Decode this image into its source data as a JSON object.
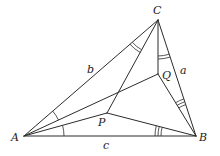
{
  "figure": {
    "width": 220,
    "height": 156,
    "stroke_color": "#2b2b2b",
    "points": {
      "A": {
        "x": 24,
        "y": 136,
        "label": "A",
        "lx": 11,
        "ly": 141
      },
      "B": {
        "x": 196,
        "y": 136,
        "label": "B",
        "lx": 199,
        "ly": 141
      },
      "C": {
        "x": 158,
        "y": 20,
        "label": "C",
        "lx": 153,
        "ly": 14
      },
      "P": {
        "x": 107,
        "y": 113,
        "label": "P",
        "lx": 98,
        "ly": 126
      },
      "Q": {
        "x": 158,
        "y": 74,
        "label": "Q",
        "lx": 162,
        "ly": 79
      }
    },
    "segments": [
      [
        "A",
        "B"
      ],
      [
        "B",
        "C"
      ],
      [
        "C",
        "A"
      ],
      [
        "A",
        "Q"
      ],
      [
        "A",
        "P"
      ],
      [
        "P",
        "B"
      ],
      [
        "P",
        "C"
      ],
      [
        "Q",
        "B"
      ],
      [
        "C",
        "Q"
      ]
    ],
    "side_labels": [
      {
        "text": "a",
        "x": 180,
        "y": 74
      },
      {
        "text": "b",
        "x": 87,
        "y": 73
      },
      {
        "text": "c",
        "x": 103,
        "y": 149
      }
    ],
    "angle_marks": [
      {
        "vertex": "A",
        "from": "Q",
        "to": "C",
        "count": 1,
        "r": 38
      },
      {
        "vertex": "A",
        "from": "B",
        "to": "P",
        "count": 1,
        "r": 40
      },
      {
        "vertex": "C",
        "from": "P",
        "to": "A",
        "count": 2,
        "r": 34
      },
      {
        "vertex": "C",
        "from": "B",
        "to": "Q",
        "count": 2,
        "r": 36
      },
      {
        "vertex": "B",
        "from": "P",
        "to": "A",
        "count": 3,
        "r": 35
      },
      {
        "vertex": "B",
        "from": "C",
        "to": "Q",
        "count": 3,
        "r": 33
      }
    ]
  }
}
